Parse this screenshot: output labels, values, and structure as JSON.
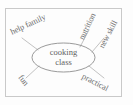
{
  "diagram": {
    "type": "word-web",
    "background_color": "#fdfdfd",
    "ink_color": "#6e6e6e",
    "frame_color": "#c9c9c9",
    "center": {
      "shape": "ellipse",
      "line1": "cooking",
      "line2": "class",
      "full_text": "cooking class"
    },
    "branches": [
      {
        "label": "help family",
        "position": "upper-left",
        "rotation_deg": -25
      },
      {
        "label": "nutrition",
        "position": "upper-right",
        "rotation_deg": -64
      },
      {
        "label": "new skill",
        "position": "right",
        "rotation_deg": -62
      },
      {
        "label": "fun",
        "position": "lower-left",
        "rotation_deg": 52
      },
      {
        "label": "practical",
        "position": "lower-right",
        "rotation_deg": 28
      }
    ]
  }
}
